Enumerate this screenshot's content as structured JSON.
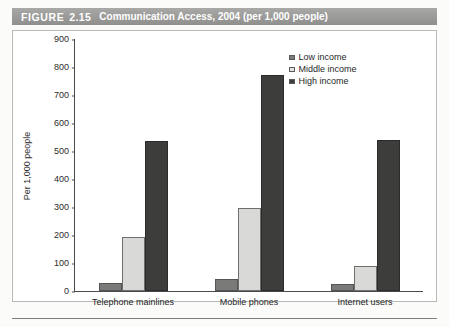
{
  "figure": {
    "label": "FIGURE",
    "number": "2.15",
    "caption": "Communication Access, 2004 (per 1,000 people)"
  },
  "legend": {
    "position": "top-right",
    "items": [
      {
        "label": "Low income",
        "color": "#7a7a78"
      },
      {
        "label": "Middle income",
        "color": "#e3e3e1"
      },
      {
        "label": "High income",
        "color": "#3d3d3c"
      }
    ]
  },
  "chart_data": {
    "type": "bar",
    "title": "Communication Access, 2004 (per 1,000 people)",
    "xlabel": "",
    "ylabel": "Per 1,000 people",
    "ylim": [
      0,
      900
    ],
    "ytick_step": 100,
    "yticks": [
      "900",
      "800",
      "700",
      "600",
      "500",
      "400",
      "300",
      "200",
      "100",
      "0"
    ],
    "grid": false,
    "categories": [
      "Telephone mainlines",
      "Mobile phones",
      "Internet users"
    ],
    "series": [
      {
        "name": "Low income",
        "color": "#7a7a78",
        "values": [
          30,
          42,
          25
        ]
      },
      {
        "name": "Middle income",
        "color": "#d9d9d7",
        "values": [
          192,
          295,
          90
        ]
      },
      {
        "name": "High income",
        "color": "#3d3d3c",
        "values": [
          536,
          772,
          540
        ]
      }
    ]
  }
}
